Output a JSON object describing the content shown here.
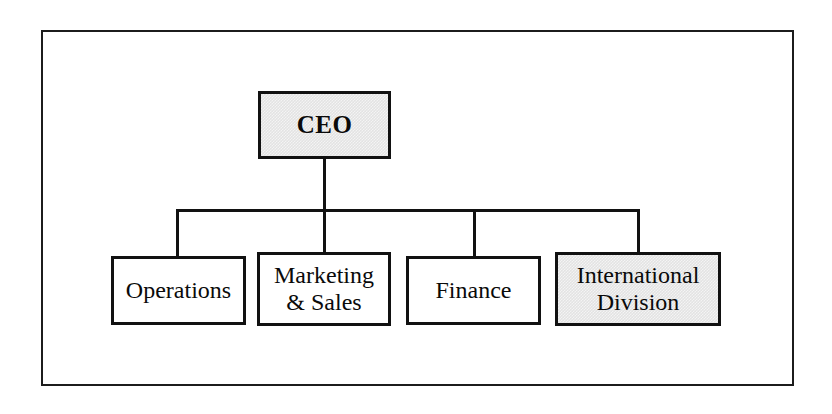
{
  "diagram": {
    "type": "organization-chart",
    "title": "",
    "frame": {
      "border_color": "#1c1c1c",
      "background": "#ffffff"
    },
    "colors": {
      "line": "#121212",
      "box_border": "#111111",
      "box_fill_default": "#ffffff",
      "box_fill_highlight": "#e3e3e3",
      "text": "#0a0a0a"
    },
    "root": {
      "id": "ceo",
      "label": "CEO",
      "highlighted": true
    },
    "children": [
      {
        "id": "operations",
        "label": "Operations",
        "highlighted": false
      },
      {
        "id": "marketing-sales",
        "label": "Marketing\n& Sales",
        "highlighted": false
      },
      {
        "id": "finance",
        "label": "Finance",
        "highlighted": false
      },
      {
        "id": "international-division",
        "label": "International\nDivision",
        "highlighted": true
      }
    ]
  }
}
